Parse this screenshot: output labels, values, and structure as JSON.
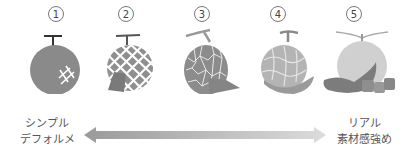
{
  "items": [
    {
      "number": "1",
      "name": "melon-simple"
    },
    {
      "number": "2",
      "name": "melon-grid"
    },
    {
      "number": "3",
      "name": "melon-net"
    },
    {
      "number": "4",
      "name": "melon-semi-real"
    },
    {
      "number": "5",
      "name": "melon-real"
    }
  ],
  "scale": {
    "left_label": [
      "シンプル",
      "デフォルメ"
    ],
    "right_label": [
      "リアル",
      "素材感強め"
    ],
    "arrow_gradient": {
      "from": "#9a9a9a",
      "to": "#dcdcdc"
    }
  },
  "colors": {
    "melon_dark": "#8a8a8a",
    "melon_mid": "#a8a8a8",
    "melon_light": "#c8c8c8",
    "net": "#ffffff"
  }
}
